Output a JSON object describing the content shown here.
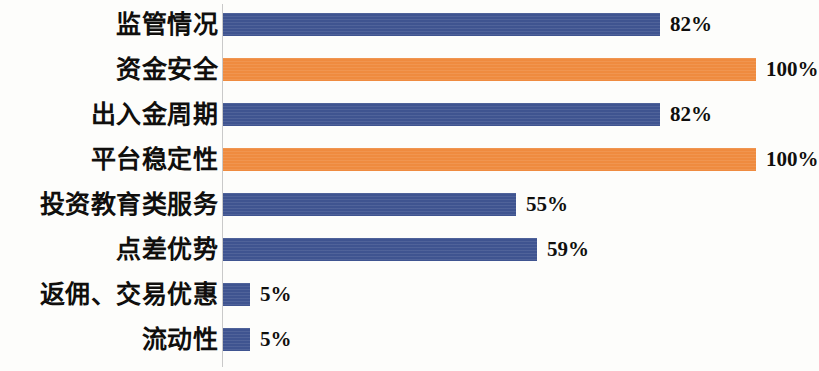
{
  "chart_data": {
    "type": "bar",
    "orientation": "horizontal",
    "title": "",
    "subtitle": "",
    "xlabel": "",
    "ylabel": "",
    "xlim": [
      0,
      100
    ],
    "grid": false,
    "legend": "none",
    "value_suffix": "%",
    "categories": [
      "监管情况",
      "资金安全",
      "出入金周期",
      "平台稳定性",
      "投资教育类服务",
      "点差优势",
      "返佣、交易优惠",
      "流动性"
    ],
    "values": [
      82,
      100,
      82,
      100,
      55,
      59,
      5,
      5
    ],
    "value_labels": [
      "82%",
      "100%",
      "82%",
      "100%",
      "55%",
      "59%",
      "5%",
      "5%"
    ],
    "bar_colors": [
      "#3f5490",
      "#ef8b3f",
      "#3f5490",
      "#ef8b3f",
      "#3f5490",
      "#3f5490",
      "#3f5490",
      "#3f5490"
    ],
    "series": [
      {
        "name": "",
        "values": [
          82,
          100,
          82,
          100,
          55,
          59,
          5,
          5
        ]
      }
    ],
    "colors": {
      "primary": "#3f5490",
      "accent": "#ef8b3f",
      "axis_line": "#c9c9c9",
      "text": "#100f0d",
      "background": "#fdfdfb"
    }
  }
}
